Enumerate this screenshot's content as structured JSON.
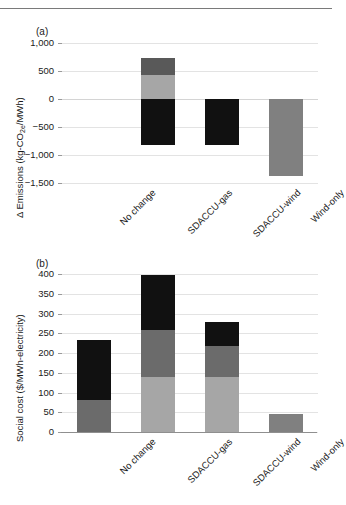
{
  "figure": {
    "panel_a_tag": "(a)",
    "panel_b_tag": "(b)"
  },
  "colors": {
    "black": "#111111",
    "dark_gray": "#595959",
    "mid_gray": "#6b6b6b",
    "light_gray": "#a6a6a6",
    "wind_gray": "#808080",
    "grid": "#e3e3e3",
    "axis": "#8f8f8f",
    "text": "#1a1a1a"
  },
  "categories": [
    "No change",
    "SDACCU-gas",
    "SDACCU-wind",
    "Wind-only"
  ],
  "chart_data": [
    {
      "type": "bar",
      "id": "panel-a",
      "title": "(a)",
      "xlabel": "",
      "ylabel": "Δ Emissions (kg-CO2e/MWh)",
      "ylabel_parts": {
        "pre": "Δ Emissions (kg-CO",
        "sub": "2e",
        "post": "/MWh)"
      },
      "categories": [
        "No change",
        "SDACCU-gas",
        "SDACCU-wind",
        "Wind-only"
      ],
      "ylim": [
        -1500,
        1000
      ],
      "yticks": [
        1000,
        500,
        0,
        -500,
        -1000,
        -1500
      ],
      "ytick_labels": [
        "1,000",
        "500",
        "0",
        "−500",
        "−1,000",
        "−1,500"
      ],
      "grid": true,
      "legend": "none",
      "stacked": true,
      "series": [
        {
          "name": "segment-1",
          "color": "#111111",
          "values": [
            0,
            -820,
            -820,
            0
          ]
        },
        {
          "name": "segment-2",
          "color": "#a6a6a6",
          "values": [
            0,
            430,
            0,
            -1370
          ]
        },
        {
          "name": "segment-3",
          "color": "#595959",
          "values": [
            0,
            310,
            0,
            0
          ]
        }
      ],
      "bars": [
        {
          "category": "No change",
          "segments": []
        },
        {
          "category": "SDACCU-gas",
          "segments": [
            {
              "from": -820,
              "to": 0,
              "color": "#111111"
            },
            {
              "from": 0,
              "to": 430,
              "color": "#a6a6a6"
            },
            {
              "from": 430,
              "to": 740,
              "color": "#595959"
            }
          ]
        },
        {
          "category": "SDACCU-wind",
          "segments": [
            {
              "from": -820,
              "to": 0,
              "color": "#111111"
            }
          ]
        },
        {
          "category": "Wind-only",
          "segments": [
            {
              "from": -1370,
              "to": 0,
              "color": "#808080"
            }
          ]
        }
      ]
    },
    {
      "type": "bar",
      "id": "panel-b",
      "title": "(b)",
      "xlabel": "",
      "ylabel": "Social cost ($/MWh-electricity)",
      "categories": [
        "No change",
        "SDACCU-gas",
        "SDACCU-wind",
        "Wind-only"
      ],
      "ylim": [
        0,
        400
      ],
      "yticks": [
        0,
        50,
        100,
        150,
        200,
        250,
        300,
        350,
        400
      ],
      "ytick_labels": [
        "0",
        "50",
        "100",
        "150",
        "200",
        "250",
        "300",
        "350",
        "400"
      ],
      "grid": true,
      "legend": "none",
      "stacked": true,
      "series": [
        {
          "name": "segment-1",
          "color": "#a6a6a6",
          "values": [
            0,
            138,
            138,
            45
          ]
        },
        {
          "name": "segment-2",
          "color": "#6b6b6b",
          "values": [
            80,
            119,
            80,
            0
          ]
        },
        {
          "name": "segment-3",
          "color": "#111111",
          "values": [
            153,
            141,
            60,
            0
          ]
        }
      ],
      "bars": [
        {
          "category": "No change",
          "segments": [
            {
              "from": 0,
              "to": 80,
              "color": "#6b6b6b"
            },
            {
              "from": 80,
              "to": 233,
              "color": "#111111"
            }
          ]
        },
        {
          "category": "SDACCU-gas",
          "segments": [
            {
              "from": 0,
              "to": 138,
              "color": "#a6a6a6"
            },
            {
              "from": 138,
              "to": 257,
              "color": "#6b6b6b"
            },
            {
              "from": 257,
              "to": 398,
              "color": "#111111"
            }
          ]
        },
        {
          "category": "SDACCU-wind",
          "segments": [
            {
              "from": 0,
              "to": 138,
              "color": "#a6a6a6"
            },
            {
              "from": 138,
              "to": 218,
              "color": "#6b6b6b"
            },
            {
              "from": 218,
              "to": 278,
              "color": "#111111"
            }
          ]
        },
        {
          "category": "Wind-only",
          "segments": [
            {
              "from": 0,
              "to": 45,
              "color": "#808080"
            }
          ]
        }
      ]
    }
  ]
}
